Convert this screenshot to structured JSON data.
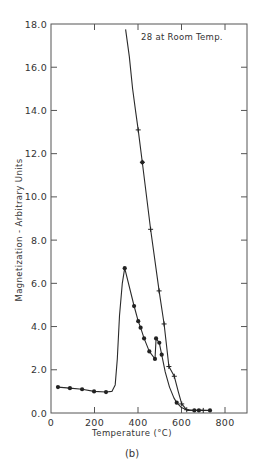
{
  "chart_data": {
    "type": "line",
    "title": "",
    "annotation": "28 at Room Temp.",
    "caption": "(b)",
    "xlabel": "Temperature (°C)",
    "ylabel": "Magnetization - Arbitrary Units",
    "xlim": [
      0,
      900
    ],
    "ylim": [
      0,
      18
    ],
    "x_ticks": [
      0,
      200,
      400,
      600,
      800
    ],
    "x_tick_labels": [
      "0",
      "200",
      "400",
      "600",
      "800"
    ],
    "y_ticks": [
      0,
      2,
      4,
      6,
      8,
      10,
      12,
      14,
      16,
      18
    ],
    "y_tick_labels": [
      "0.0",
      "2.0",
      "4.0",
      "6.0",
      "8.0",
      "10.0",
      "12.0",
      "14.0",
      "16.0",
      "18.0"
    ],
    "grid": false,
    "legend": null,
    "series": [
      {
        "name": "Heating (dots)",
        "marker": "dot",
        "line_style": "dashed-solid",
        "points": [
          [
            32,
            1.2
          ],
          [
            87,
            1.15
          ],
          [
            143,
            1.1
          ],
          [
            198,
            1.0
          ],
          [
            253,
            0.97
          ],
          [
            339,
            6.7
          ],
          [
            382,
            4.95
          ],
          [
            401,
            4.25
          ],
          [
            412,
            3.95
          ],
          [
            428,
            3.45
          ],
          [
            452,
            2.85
          ],
          [
            478,
            2.5
          ],
          [
            483,
            3.45
          ],
          [
            498,
            3.25
          ],
          [
            509,
            2.7
          ],
          [
            578,
            0.48
          ],
          [
            659,
            0.12
          ],
          [
            680,
            0.12
          ],
          [
            731,
            0.12
          ]
        ],
        "curve_path": [
          [
            32,
            1.2
          ],
          [
            87,
            1.15
          ],
          [
            143,
            1.1
          ],
          [
            198,
            1.0
          ],
          [
            253,
            0.97
          ],
          [
            280,
            1.0
          ],
          [
            295,
            1.3
          ],
          [
            305,
            2.5
          ],
          [
            315,
            4.5
          ],
          [
            328,
            6.0
          ],
          [
            339,
            6.7
          ],
          [
            382,
            4.95
          ],
          [
            401,
            4.25
          ],
          [
            412,
            3.95
          ],
          [
            428,
            3.45
          ],
          [
            452,
            2.85
          ],
          [
            478,
            2.5
          ],
          [
            483,
            3.45
          ],
          [
            498,
            3.25
          ],
          [
            509,
            2.7
          ],
          [
            525,
            1.9
          ],
          [
            545,
            1.2
          ],
          [
            565,
            0.7
          ],
          [
            578,
            0.48
          ],
          [
            600,
            0.25
          ],
          [
            630,
            0.12
          ],
          [
            659,
            0.12
          ],
          [
            680,
            0.12
          ],
          [
            731,
            0.12
          ]
        ]
      },
      {
        "name": "Cooling (crosses)",
        "marker": "cross",
        "line_style": "solid",
        "points": [
          [
            401,
            13.1
          ],
          [
            420,
            11.6
          ],
          [
            458,
            8.5
          ],
          [
            497,
            5.65
          ],
          [
            520,
            4.12
          ],
          [
            542,
            2.15
          ],
          [
            567,
            1.7
          ],
          [
            601,
            0.42
          ],
          [
            624,
            0.15
          ],
          [
            700,
            0.12
          ]
        ],
        "dot_on_curve": [
          [
            420,
            11.6
          ]
        ],
        "curve_path": [
          [
            343,
            17.75
          ],
          [
            360,
            16.5
          ],
          [
            375,
            15.0
          ],
          [
            390,
            13.9
          ],
          [
            401,
            13.1
          ],
          [
            420,
            11.6
          ],
          [
            458,
            8.5
          ],
          [
            497,
            5.65
          ],
          [
            520,
            4.12
          ],
          [
            542,
            2.15
          ],
          [
            567,
            1.7
          ],
          [
            585,
            1.0
          ],
          [
            601,
            0.42
          ],
          [
            624,
            0.15
          ],
          [
            650,
            0.12
          ],
          [
            700,
            0.12
          ]
        ]
      }
    ]
  }
}
